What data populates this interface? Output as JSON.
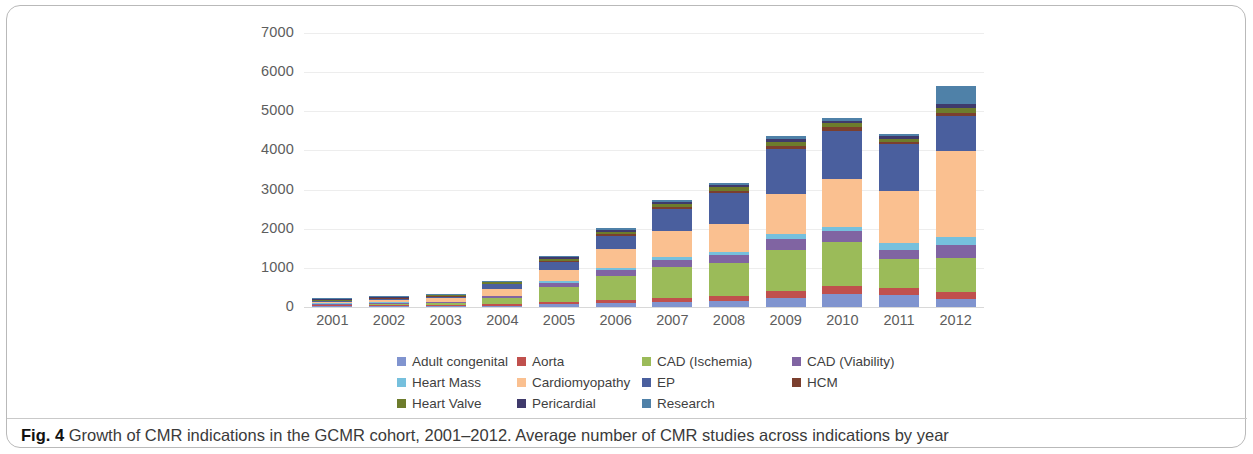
{
  "figure": {
    "caption_prefix": "Fig. 4",
    "caption_text": "Growth of CMR indications in the GCMR cohort, 2001–2012. Average number of CMR studies across indications by year"
  },
  "chart_data": {
    "type": "bar",
    "stacked": true,
    "title": "",
    "xlabel": "",
    "ylabel": "",
    "ylim": [
      0,
      7000
    ],
    "yticks": [
      "0",
      "1000",
      "2000",
      "3000",
      "4000",
      "5000",
      "6000",
      "7000"
    ],
    "grid": true,
    "legend_position": "bottom",
    "categories": [
      "2001",
      "2002",
      "2003",
      "2004",
      "2005",
      "2006",
      "2007",
      "2008",
      "2009",
      "2010",
      "2011",
      "2012"
    ],
    "series": [
      {
        "name": "Adult congenital",
        "color": "#8094cf",
        "values": [
          5,
          15,
          20,
          35,
          70,
          100,
          130,
          150,
          230,
          330,
          300,
          200
        ]
      },
      {
        "name": "Aorta",
        "color": "#c0504d",
        "values": [
          5,
          10,
          15,
          30,
          55,
          80,
          110,
          120,
          175,
          210,
          175,
          175
        ]
      },
      {
        "name": "CAD (Ischemia)",
        "color": "#9bbb59",
        "values": [
          10,
          40,
          55,
          160,
          390,
          600,
          780,
          860,
          1060,
          1130,
          760,
          870
        ]
      },
      {
        "name": "CAD (Viability)",
        "color": "#8064a2",
        "values": [
          5,
          20,
          25,
          45,
          100,
          160,
          190,
          210,
          280,
          260,
          210,
          330
        ]
      },
      {
        "name": "Heart Mass",
        "color": "#76c0dd",
        "values": [
          3,
          8,
          10,
          20,
          40,
          55,
          60,
          60,
          110,
          120,
          180,
          220
        ]
      },
      {
        "name": "Cardiomyopathy",
        "color": "#fac090",
        "values": [
          15,
          55,
          80,
          180,
          300,
          490,
          670,
          720,
          1040,
          1230,
          1330,
          2200
        ]
      },
      {
        "name": "EP",
        "color": "#4a5f9e",
        "values": [
          8,
          25,
          35,
          110,
          200,
          330,
          560,
          790,
          1150,
          1230,
          1200,
          880
        ]
      },
      {
        "name": "HCM",
        "color": "#7b3f2e",
        "values": [
          2,
          5,
          8,
          15,
          30,
          40,
          50,
          55,
          70,
          80,
          65,
          85
        ]
      },
      {
        "name": "Heart Valve",
        "color": "#6d7c2c",
        "values": [
          3,
          10,
          15,
          30,
          55,
          75,
          85,
          95,
          110,
          100,
          85,
          130
        ]
      },
      {
        "name": "Pericardial",
        "color": "#3f3a6b",
        "values": [
          2,
          6,
          10,
          20,
          35,
          45,
          50,
          55,
          70,
          70,
          60,
          90
        ]
      },
      {
        "name": "Research",
        "color": "#4f81a8",
        "values": [
          2,
          6,
          7,
          15,
          25,
          35,
          40,
          45,
          80,
          70,
          55,
          470
        ]
      }
    ],
    "totals": [
      60,
      200,
      280,
      660,
      1300,
      2010,
      2725,
      3160,
      4375,
      4830,
      4420,
      5650
    ]
  },
  "legend": {
    "rows": [
      [
        {
          "label": "Adult congenital",
          "color": "#8094cf"
        },
        {
          "label": "Aorta",
          "color": "#c0504d"
        },
        {
          "label": "CAD (Ischemia)",
          "color": "#9bbb59"
        },
        {
          "label": "CAD (Viability)",
          "color": "#8064a2"
        }
      ],
      [
        {
          "label": "Heart Mass",
          "color": "#76c0dd"
        },
        {
          "label": "Cardiomyopathy",
          "color": "#fac090"
        },
        {
          "label": "EP",
          "color": "#4a5f9e"
        },
        {
          "label": "HCM",
          "color": "#7b3f2e"
        }
      ],
      [
        {
          "label": "Heart Valve",
          "color": "#6d7c2c"
        },
        {
          "label": "Pericardial",
          "color": "#3f3a6b"
        },
        {
          "label": "Research",
          "color": "#4f81a8"
        }
      ]
    ]
  }
}
